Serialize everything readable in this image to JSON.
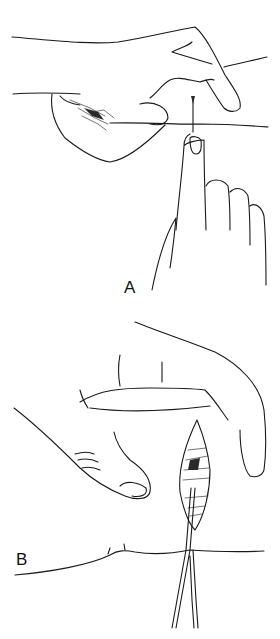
{
  "figure": {
    "panels": [
      {
        "id": "A",
        "label": "A",
        "description": "Hand pinching skin fold while finger of other hand palpates below; needle inserted at skin line"
      },
      {
        "id": "B",
        "label": "B",
        "description": "Fingers spreading skin above an elliptical incision; forceps holding tissue open through the incision"
      }
    ],
    "style": {
      "line_color": "#1a1a1a",
      "background": "#ffffff"
    }
  }
}
